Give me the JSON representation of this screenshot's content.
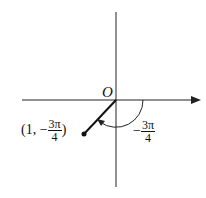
{
  "diagram": {
    "origin_label": "O",
    "point_label": {
      "prefix": "(1, −",
      "numerator": "3π",
      "denominator": "4",
      "suffix": ")"
    },
    "angle_label": {
      "sign": "−",
      "numerator": "3π",
      "denominator": "4"
    },
    "point": {
      "r": 1,
      "theta": "-3π/4"
    }
  }
}
